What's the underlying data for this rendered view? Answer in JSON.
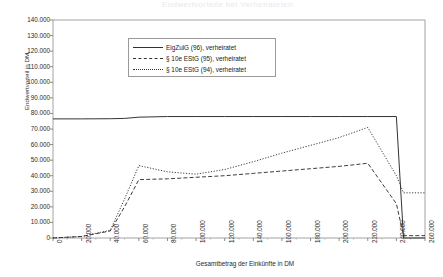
{
  "title": "Endwertvorteile bei Verheirateten",
  "axes": {
    "ylabel": "Endwertvorteil in DM",
    "xlabel": "Gesamtbetrag der Einkünfte in DM",
    "yticks": [
      "140.000",
      "130.000",
      "120.000",
      "110.000",
      "100.000",
      "90.000",
      "80.000",
      "70.000",
      "60.000",
      "50.000",
      "40.000",
      "30.000",
      "20.000",
      "10.000",
      "0"
    ],
    "xticks": [
      "0",
      "20.000",
      "40.000",
      "60.000",
      "80.000",
      "100.000",
      "120.000",
      "140.000",
      "160.000",
      "180.000",
      "200.000",
      "220.000",
      "240.000",
      "260.000"
    ]
  },
  "legend": {
    "items": [
      {
        "label": "EigZulG (96), verheiratet",
        "style": "solid"
      },
      {
        "label": "§ 10e EStG (95), verheiratet",
        "style": "dashed"
      },
      {
        "label": "§ 10e EStG (94), verheiratet",
        "style": "dotted"
      }
    ]
  },
  "chart_data": {
    "type": "line",
    "title": "Endwertvorteile bei Verheirateten",
    "xlabel": "Gesamtbetrag der Einkünfte in DM",
    "ylabel": "Endwertvorteil in DM",
    "xlim": [
      0,
      260000
    ],
    "ylim": [
      0,
      140000
    ],
    "ytick_step": 10000,
    "xtick_step": 20000,
    "grid": false,
    "legend_position": "upper-center",
    "x": [
      0,
      20000,
      40000,
      50000,
      60000,
      80000,
      100000,
      120000,
      140000,
      160000,
      180000,
      200000,
      220000,
      240000,
      245000,
      260000
    ],
    "series": [
      {
        "name": "EigZulG (96), verheiratet",
        "style": "solid",
        "color": "#333333",
        "values": [
          76500,
          76500,
          76600,
          76800,
          77600,
          78000,
          78000,
          78000,
          78000,
          78000,
          78000,
          78000,
          78000,
          78000,
          0,
          0
        ]
      },
      {
        "name": "§ 10e EStG (95), verheiratet",
        "style": "dashed",
        "color": "#333333",
        "values": [
          0,
          1000,
          4500,
          20000,
          37500,
          38000,
          39000,
          40000,
          41500,
          43000,
          44500,
          46000,
          48000,
          22000,
          1500,
          1500
        ]
      },
      {
        "name": "§ 10e EStG (94), verheiratet",
        "style": "dotted",
        "color": "#333333",
        "values": [
          0,
          1000,
          5000,
          25000,
          46500,
          42500,
          41000,
          44000,
          49000,
          54500,
          59500,
          64500,
          71000,
          40000,
          29000,
          29000
        ]
      }
    ]
  },
  "plot": {
    "left": 53,
    "right": 425,
    "top": 20,
    "bottom": 238
  }
}
